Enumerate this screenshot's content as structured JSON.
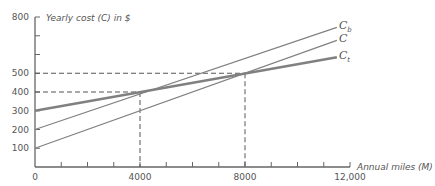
{
  "chart_data": {
    "type": "line",
    "title": "",
    "xlabel": "Annual miles (M)",
    "ylabel": "Yearly cost (C) in $",
    "xlim": [
      0,
      12000
    ],
    "ylim": [
      0,
      800
    ],
    "x_ticks": [
      0,
      4000,
      8000,
      12000
    ],
    "x_tick_labels": [
      "0",
      "4000",
      "8000",
      "12,000"
    ],
    "x_minor_tick_step": 1000,
    "y_ticks": [
      100,
      200,
      300,
      400,
      500,
      800
    ],
    "y_tick_labels": [
      "100",
      "200",
      "300",
      "400",
      "500",
      "800"
    ],
    "y_minor_ticks": [
      600,
      700
    ],
    "grid": false,
    "series": [
      {
        "name": "C_b",
        "label_main": "C",
        "label_sub": "b",
        "x": [
          0,
          11500
        ],
        "values": [
          200,
          745
        ],
        "color": "#808080",
        "width": 1.2
      },
      {
        "name": "C",
        "label_main": "C",
        "label_sub": "",
        "x": [
          0,
          11500
        ],
        "values": [
          100,
          675
        ],
        "color": "#808080",
        "width": 1.2
      },
      {
        "name": "C_t",
        "label_main": "C",
        "label_sub": "t",
        "x": [
          0,
          11500
        ],
        "values": [
          300,
          585
        ],
        "color": "#808080",
        "width": 2.5
      }
    ],
    "reference_lines": [
      {
        "type": "dashed",
        "from": [
          0,
          400
        ],
        "to": [
          4000,
          400
        ]
      },
      {
        "type": "dashed",
        "from": [
          4000,
          400
        ],
        "to": [
          4000,
          0
        ]
      },
      {
        "type": "dashed",
        "from": [
          0,
          500
        ],
        "to": [
          8000,
          500
        ]
      },
      {
        "type": "dashed",
        "from": [
          8000,
          500
        ],
        "to": [
          8000,
          0
        ]
      }
    ],
    "annotations": [
      {
        "text": "Intersection C_b / C_t",
        "x": 4000,
        "y": 400
      },
      {
        "text": "Intersection C / C_t",
        "x": 8000,
        "y": 500
      }
    ]
  }
}
